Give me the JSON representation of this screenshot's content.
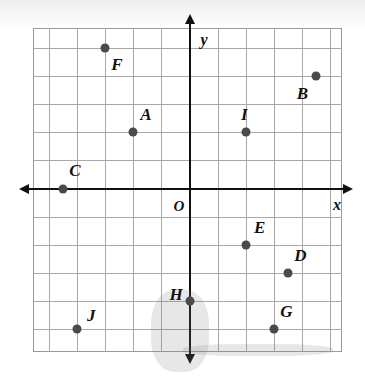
{
  "chart_data": {
    "type": "scatter",
    "title": "",
    "xlabel": "x",
    "ylabel": "y",
    "origin_label": "O",
    "grid": true,
    "grid_step": 1,
    "xlim": [
      -5.5,
      5.5
    ],
    "ylim": [
      -6,
      5.5
    ],
    "point_color": "#4a4a4a",
    "axis_color": "#111111",
    "grid_color": "#a8a8a8",
    "points": [
      {
        "label": "A",
        "x": -2,
        "y": 2,
        "label_dx": 0.45,
        "label_dy": 0.62
      },
      {
        "label": "B",
        "x": 4.5,
        "y": 4,
        "label_dx": -0.48,
        "label_dy": -0.62
      },
      {
        "label": "C",
        "x": -4.5,
        "y": 0,
        "label_dx": 0.42,
        "label_dy": 0.62
      },
      {
        "label": "D",
        "x": 3.5,
        "y": -3,
        "label_dx": 0.45,
        "label_dy": 0.6
      },
      {
        "label": "E",
        "x": 2,
        "y": -2,
        "label_dx": 0.5,
        "label_dy": 0.58
      },
      {
        "label": "F",
        "x": -3,
        "y": 5,
        "label_dx": 0.42,
        "label_dy": -0.62
      },
      {
        "label": "G",
        "x": 3,
        "y": -5,
        "label_dx": 0.45,
        "label_dy": 0.6
      },
      {
        "label": "H",
        "x": 0,
        "y": -4,
        "label_dx": -0.48,
        "label_dy": 0.2
      },
      {
        "label": "I",
        "x": 2,
        "y": 2,
        "label_dx": -0.05,
        "label_dy": 0.62
      },
      {
        "label": "J",
        "x": -4,
        "y": -5,
        "label_dx": 0.5,
        "label_dy": 0.45
      }
    ],
    "axis_labels": {
      "x": {
        "text": "x",
        "px": 337,
        "py": 205
      },
      "y": {
        "text": "y",
        "px": 204,
        "py": 40
      }
    }
  }
}
